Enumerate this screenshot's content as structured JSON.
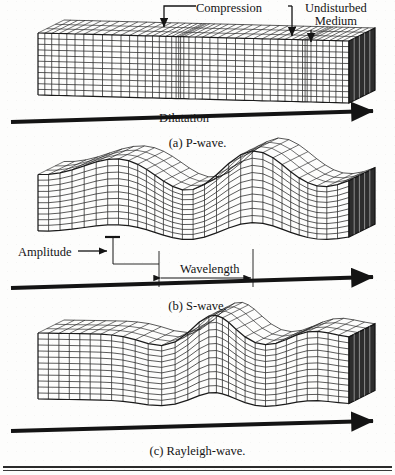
{
  "figure": {
    "type": "textbook-illustration",
    "background_color": "#fdfdfc",
    "ink_color": "#141414",
    "panels": [
      {
        "id": "p-wave",
        "caption": "(a) P-wave.",
        "wave_type": "compressional",
        "annotations": [
          {
            "name": "compression",
            "text": "Compression",
            "leader": "double-ended-down-arrows"
          },
          {
            "name": "undisturbed-medium",
            "text": "Undisturbed\nMedium",
            "line1": "Undisturbed",
            "line2": "Medium",
            "leader": "down-arrow"
          },
          {
            "name": "dilatation",
            "text": "Dilatation",
            "leader": "none"
          }
        ],
        "direction_arrow": {
          "label": "",
          "visible": true,
          "points": "right"
        }
      },
      {
        "id": "s-wave",
        "caption": "(b) S-wave.",
        "wave_type": "shear-transverse",
        "annotations": [
          {
            "name": "amplitude",
            "text": "Amplitude",
            "leader": "right-arrow"
          },
          {
            "name": "wavelength",
            "text": "Wavelength",
            "leader": "double-headed-horizontal-arrow"
          }
        ],
        "direction_arrow": {
          "label": "",
          "visible": true,
          "points": "right"
        }
      },
      {
        "id": "rayleigh-wave",
        "caption": "(c) Rayleigh-wave.",
        "wave_type": "surface-retrograde-elliptical",
        "annotations": [],
        "direction_arrow": {
          "label": "",
          "visible": true,
          "points": "right"
        }
      }
    ],
    "footer_rule": {
      "visible": true,
      "style": "double-horizontal-rule"
    }
  },
  "labels": {
    "compression": "Compression",
    "undisturbed_line1": "Undisturbed",
    "undisturbed_line2": "Medium",
    "dilatation": "Dilatation",
    "amplitude": "Amplitude",
    "wavelength": "Wavelength",
    "caption_a": "(a) P-wave.",
    "caption_b": "(b) S-wave.",
    "caption_c": "(c) Rayleigh-wave."
  }
}
